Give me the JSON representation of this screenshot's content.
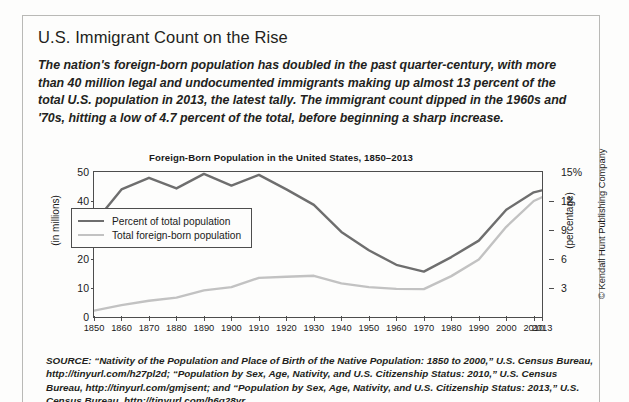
{
  "article": {
    "headline": "U.S. Immigrant Count on the Rise",
    "deck": "The nation's foreign-born population has doubled in the past quarter-century, with more than 40 million legal and undocumented immigrants making up almost 13 percent of the total U.S. population in 2013, the latest tally. The immigrant count dipped in the 1960s and '70s, hitting a low of 4.7 percent of the total, before beginning a sharp increase.",
    "source": "SOURCE: “Nativity of the Population and Place of Birth of the Native Population: 1850 to 2000,” U.S. Census Bureau, http://tinyurl.com/h27pl2d; “Population by Sex, Age, Nativity, and U.S. Citizenship Status: 2010,” U.S. Census Bureau, http://tinyurl.com/gmjsent; and “Population by Sex, Age, Nativity, and U.S. Citizenship Status: 2013,” U.S. Census Bureau, http://tinyurl.com/h6q28yr",
    "copyright": "© Kendall Hunt Publishing Company"
  },
  "colors": {
    "percent_line": "#6e6e6e",
    "total_line": "#c2c2c2",
    "axis": "#4d4d4d",
    "text": "#231f20",
    "page_bg": "#fdfdfc",
    "border": "#b9b9b6"
  },
  "chart_data": {
    "type": "line",
    "title": "Foreign-Born Population in the United States, 1850–2013",
    "xlabel": "",
    "ylabel": "(in millions)",
    "y2label": "(percentage)",
    "grid": false,
    "legend_position": "inside-left",
    "x": [
      1850,
      1860,
      1870,
      1880,
      1890,
      1900,
      1910,
      1920,
      1930,
      1940,
      1950,
      1960,
      1970,
      1980,
      1990,
      2000,
      2010,
      2013
    ],
    "xticklabels": [
      "1850",
      "1860",
      "1870",
      "1880",
      "1890",
      "1900",
      "1910",
      "1920",
      "1930",
      "1940",
      "1950",
      "1960",
      "1970",
      "1980",
      "1990",
      "2000",
      "2010",
      "2013"
    ],
    "ylim": [
      0,
      50
    ],
    "yticklabels": [
      "0",
      "10",
      "20",
      "30",
      "40",
      "50"
    ],
    "yticks": [
      0,
      10,
      20,
      30,
      40,
      50
    ],
    "y2lim": [
      0,
      15
    ],
    "y2ticklabels": [
      "3",
      "6",
      "9",
      "12",
      "15%"
    ],
    "y2ticks": [
      3,
      6,
      9,
      12,
      15
    ],
    "series": [
      {
        "name": "Percent of total population",
        "axis": "right",
        "unit": "percent",
        "color": "#6e6e6e",
        "values": [
          9.7,
          13.2,
          14.4,
          13.3,
          14.8,
          13.6,
          14.7,
          13.2,
          11.6,
          8.8,
          6.9,
          5.4,
          4.7,
          6.2,
          7.9,
          11.1,
          12.9,
          13.1
        ]
      },
      {
        "name": "Total foreign-born population",
        "axis": "left",
        "unit": "millions",
        "color": "#c2c2c2",
        "values": [
          2.2,
          4.1,
          5.6,
          6.7,
          9.2,
          10.3,
          13.5,
          13.9,
          14.2,
          11.6,
          10.3,
          9.7,
          9.6,
          14.1,
          19.8,
          31.1,
          40.0,
          41.3
        ]
      }
    ]
  }
}
